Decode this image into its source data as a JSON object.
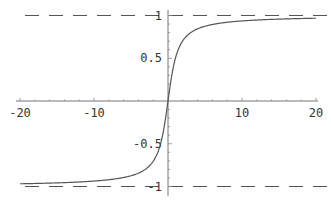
{
  "chart_data": {
    "type": "line",
    "title": "",
    "xlabel": "",
    "ylabel": "",
    "xlim": [
      -20,
      20
    ],
    "ylim": [
      -1,
      1
    ],
    "grid": false,
    "legend": null,
    "x_ticks": [
      -20,
      -10,
      10,
      20
    ],
    "x_tick_labels": [
      "-20",
      "-10",
      "10",
      "20"
    ],
    "y_ticks": [
      1,
      0.5,
      -0.5,
      -1
    ],
    "y_tick_labels": [
      "1",
      "0.5",
      "-0.5",
      "-1"
    ],
    "series": [
      {
        "name": "(2/π)·arctan(x)",
        "x": [
          -20,
          -15,
          -10,
          -7,
          -5,
          -4,
          -3,
          -2,
          -1.5,
          -1,
          -0.5,
          0,
          0.5,
          1,
          1.5,
          2,
          3,
          4,
          5,
          7,
          10,
          15,
          20
        ],
        "values": [
          -0.968,
          -0.958,
          -0.937,
          -0.91,
          -0.874,
          -0.844,
          -0.795,
          -0.705,
          -0.626,
          -0.5,
          -0.295,
          0,
          0.295,
          0.5,
          0.626,
          0.705,
          0.795,
          0.844,
          0.874,
          0.91,
          0.937,
          0.958,
          0.968
        ],
        "color": "#555555"
      }
    ],
    "annotations": [
      {
        "type": "hline",
        "y": 1,
        "style": "dashed",
        "label": "asymptote y=1"
      },
      {
        "type": "hline",
        "y": -1,
        "style": "dashed",
        "label": "asymptote y=-1"
      }
    ]
  }
}
